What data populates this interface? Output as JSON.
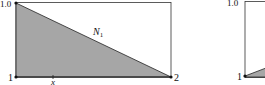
{
  "diagrams": [
    {
      "id": "left-panel",
      "y_top_label": "1.0",
      "node_left_label": "1",
      "node_right_label": "2",
      "shape_function_label": "N",
      "shape_function_subscript": "1",
      "axis_label": "x",
      "fill_color": "#a6a6a6",
      "line_color": "#222222"
    },
    {
      "id": "right-panel",
      "y_top_label": "1.0",
      "node_left_label": "1",
      "fill_color": "#a6a6a6",
      "line_color": "#222222"
    }
  ]
}
